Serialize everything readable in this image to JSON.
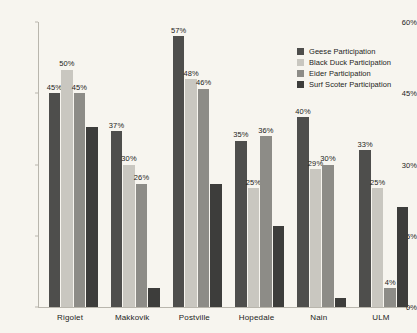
{
  "chart_data": {
    "type": "bar",
    "title": "",
    "subtitle": "",
    "xlabel": "",
    "ylabel": "",
    "ylim": [
      0,
      60
    ],
    "ytick_labels": [
      "0%",
      "15%",
      "30%",
      "45%",
      "60%"
    ],
    "ytick_values": [
      0,
      15,
      30,
      45,
      60
    ],
    "grid": false,
    "legend_position": "top-right",
    "categories": [
      "Rigolet",
      "Makkovik",
      "Postville",
      "Hopedale",
      "Nain",
      "ULM"
    ],
    "series": [
      {
        "name": "Geese Participation",
        "color": "#4e4e4c",
        "values": [
          45,
          37,
          57,
          35,
          40,
          33
        ],
        "labels": [
          "45%",
          "37%",
          "57%",
          "35%",
          "40%",
          "33%"
        ]
      },
      {
        "name": "Black Duck Participation",
        "color": "#c9c7c0",
        "values": [
          50,
          30,
          48,
          25,
          29,
          25
        ],
        "labels": [
          "50%",
          "30%",
          "48%",
          "25%",
          "29%",
          "25%"
        ]
      },
      {
        "name": "Eider Participation",
        "color": "#8d8c87",
        "values": [
          45,
          26,
          46,
          36,
          30,
          4
        ],
        "labels": [
          "45%",
          "26%",
          "46%",
          "36%",
          "30%",
          "4%"
        ]
      },
      {
        "name": "Surf Scoter Participation",
        "color": "#3d3d3b",
        "values": [
          38,
          4,
          26,
          17,
          2,
          21
        ],
        "labels": [
          "",
          "",
          "",
          "",
          "",
          ""
        ]
      }
    ]
  },
  "legend": {
    "items": [
      {
        "label": "Geese Participation",
        "color": "#4e4e4c"
      },
      {
        "label": "Black Duck Participation",
        "color": "#c9c7c0"
      },
      {
        "label": "Eider Participation",
        "color": "#8d8c87"
      },
      {
        "label": "Surf Scoter Participation",
        "color": "#3d3d3b"
      }
    ]
  }
}
